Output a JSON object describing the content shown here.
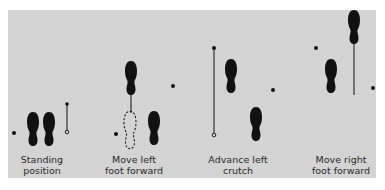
{
  "diagram": {
    "colors": {
      "background": "#ffffff",
      "panel": "#d4d4d4",
      "ink": "#111111",
      "caption": "#2a2a2a"
    },
    "steps": [
      {
        "id": "standing",
        "caption_line1": "Standing",
        "caption_line2": "position",
        "caption_x": 42,
        "caption_y": 154
      },
      {
        "id": "move-left-foot",
        "caption_line1": "Move left",
        "caption_line2": "foot forward",
        "caption_x": 134,
        "caption_y": 154
      },
      {
        "id": "advance-left-crutch",
        "caption_line1": "Advance left",
        "caption_line2": "crutch",
        "caption_x": 238,
        "caption_y": 154
      },
      {
        "id": "move-right-foot",
        "caption_line1": "Move right",
        "caption_line2": "foot forward",
        "caption_x": 341,
        "caption_y": 154
      }
    ]
  }
}
